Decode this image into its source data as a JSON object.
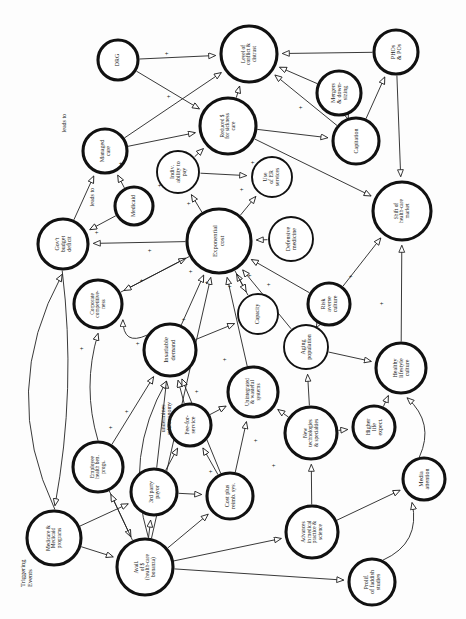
{
  "diagram": {
    "corner_label": "Triggering\nEvents",
    "rotation_note": "page rotated 90 degrees",
    "colors": {
      "node_stroke": "#111111",
      "node_fill": "#ffffff",
      "edge_stroke": "#222222",
      "background": "#ffffff"
    },
    "nodes": [
      {
        "id": "drg",
        "label": "DRG",
        "cx": 118,
        "cy": 60,
        "r": 20,
        "thick": "heavy"
      },
      {
        "id": "conflict",
        "label": "Level of\nconflict &\ndistrust",
        "cx": 249,
        "cy": 54,
        "r": 28,
        "thick": "heavy"
      },
      {
        "id": "phos",
        "label": "PHOs\n& POs",
        "cx": 396,
        "cy": 52,
        "r": 22,
        "thick": "heavy"
      },
      {
        "id": "mergers",
        "label": "Mergers\n& down-\nsizing",
        "cx": 339,
        "cy": 93,
        "r": 22,
        "thick": "heavy"
      },
      {
        "id": "reduced",
        "label": "Reduced $\nfor sickness\ncare",
        "cx": 228,
        "cy": 126,
        "r": 28,
        "thick": "heavy"
      },
      {
        "id": "capitation",
        "label": "Capitation",
        "cx": 356,
        "cy": 141,
        "r": 23,
        "thick": "heavy"
      },
      {
        "id": "managed",
        "label": "Managed\ncare",
        "cx": 105,
        "cy": 151,
        "r": 22,
        "thick": "heavy"
      },
      {
        "id": "indiv",
        "label": "Indiv.\nability to\npay",
        "cx": 178,
        "cy": 172,
        "r": 21,
        "thick": "medium"
      },
      {
        "id": "er",
        "label": "Use\nof ER\nservices",
        "cx": 272,
        "cy": 177,
        "r": 20,
        "thick": "medium"
      },
      {
        "id": "medicaid",
        "label": "Medicaid",
        "cx": 134,
        "cy": 206,
        "r": 19,
        "thick": "heavy"
      },
      {
        "id": "shift",
        "label": "Shift of\nhealth-care\nmarket",
        "cx": 402,
        "cy": 211,
        "r": 29,
        "thick": "heavy"
      },
      {
        "id": "deficit",
        "label": "Gov't\nbudget\ndeficit",
        "cx": 63,
        "cy": 244,
        "r": 25,
        "thick": "heavy"
      },
      {
        "id": "expcost",
        "label": "Exponential\ncost",
        "cx": 219,
        "cy": 241,
        "r": 32,
        "thick": "heavy"
      },
      {
        "id": "defensive",
        "label": "Defensive\nmedicine",
        "cx": 291,
        "cy": 239,
        "r": 22,
        "thick": "medium"
      },
      {
        "id": "corporate",
        "label": "Corporate\ncompetitive-\nness",
        "cx": 98,
        "cy": 304,
        "r": 24,
        "thick": "heavy"
      },
      {
        "id": "capacity",
        "label": "Capacity",
        "cx": 258,
        "cy": 314,
        "r": 20,
        "thick": "medium"
      },
      {
        "id": "risk",
        "label": "Risk\naverse\nculture",
        "cx": 329,
        "cy": 304,
        "r": 21,
        "thick": "heavy"
      },
      {
        "id": "insatiable",
        "label": "Insatiable\ndemand",
        "cx": 170,
        "cy": 350,
        "r": 26,
        "thick": "heavy"
      },
      {
        "id": "aging",
        "label": "Aging\npopulation",
        "cx": 306,
        "cy": 347,
        "r": 22,
        "thick": "medium"
      },
      {
        "id": "healthy",
        "label": "Healthy\nlifestyle\nculture",
        "cx": 401,
        "cy": 368,
        "r": 25,
        "thick": "heavy"
      },
      {
        "id": "unintegr",
        "label": "Unintegrated\n& wasteful\nsystems",
        "cx": 253,
        "cy": 392,
        "r": 25,
        "thick": "heavy"
      },
      {
        "id": "fee",
        "label": "Fee-for-\nservice",
        "cx": 190,
        "cy": 425,
        "r": 21,
        "thick": "heavy"
      },
      {
        "id": "newtech",
        "label": "New\ntechnologies\n& specialties",
        "cx": 311,
        "cy": 433,
        "r": 26,
        "thick": "heavy"
      },
      {
        "id": "higher",
        "label": "Higher\nlife\nexpect.",
        "cx": 374,
        "cy": 427,
        "r": 21,
        "thick": "heavy"
      },
      {
        "id": "employee",
        "label": "Employee\nhealth ben.\nprogs.",
        "cx": 98,
        "cy": 467,
        "r": 25,
        "thick": "heavy"
      },
      {
        "id": "thirdparty",
        "label": "3rd party\npayor",
        "cx": 154,
        "cy": 492,
        "r": 23,
        "thick": "heavy"
      },
      {
        "id": "costplus",
        "label": "Cost plus\nreimb. sys.",
        "cx": 230,
        "cy": 496,
        "r": 23,
        "thick": "heavy"
      },
      {
        "id": "media",
        "label": "Media\nattention",
        "cx": 424,
        "cy": 479,
        "r": 21,
        "thick": "heavy"
      },
      {
        "id": "medicare",
        "label": "Medicare &\nMedicaid\nprograms",
        "cx": 54,
        "cy": 538,
        "r": 27,
        "thick": "heavy"
      },
      {
        "id": "advances",
        "label": "Advances\nin medical\npractice &\nscience",
        "cx": 312,
        "cy": 532,
        "r": 26,
        "thick": "heavy"
      },
      {
        "id": "avail",
        "label": "Avail.\nof $\n(health-care\nbonanza)",
        "cx": 145,
        "cy": 567,
        "r": 28,
        "thick": "heavy"
      },
      {
        "id": "prolif",
        "label": "Prolif.\nof faddish\nstudies",
        "cx": 372,
        "cy": 582,
        "r": 23,
        "thick": "heavy"
      }
    ],
    "edge_labels": [
      {
        "id": "leadsto1",
        "text": "leads to",
        "x": 64,
        "y": 128
      },
      {
        "id": "leadsto2",
        "text": "leads to",
        "x": 92,
        "y": 202
      },
      {
        "id": "undermines",
        "text": "undermines\nmkt economy",
        "x": 166,
        "y": 420
      }
    ],
    "signs": [
      {
        "x": 166,
        "y": 50
      },
      {
        "x": 168,
        "y": 93
      },
      {
        "x": 300,
        "y": 104
      },
      {
        "x": 120,
        "y": 160
      },
      {
        "x": 159,
        "y": 182
      },
      {
        "x": 188,
        "y": 200
      },
      {
        "x": 252,
        "y": 159
      },
      {
        "x": 241,
        "y": 186
      },
      {
        "x": 96,
        "y": 229
      },
      {
        "x": 149,
        "y": 247
      },
      {
        "x": 141,
        "y": 277
      },
      {
        "x": 190,
        "y": 268
      },
      {
        "x": 206,
        "y": 279
      },
      {
        "x": 229,
        "y": 283
      },
      {
        "x": 249,
        "y": 272
      },
      {
        "x": 268,
        "y": 281
      },
      {
        "x": 81,
        "y": 345
      },
      {
        "x": 137,
        "y": 340
      },
      {
        "x": 183,
        "y": 316
      },
      {
        "x": 126,
        "y": 408
      },
      {
        "x": 110,
        "y": 424
      },
      {
        "x": 196,
        "y": 388
      },
      {
        "x": 224,
        "y": 356
      },
      {
        "x": 350,
        "y": 273
      },
      {
        "x": 381,
        "y": 300
      },
      {
        "x": 255,
        "y": 437
      },
      {
        "x": 210,
        "y": 468
      },
      {
        "x": 273,
        "y": 462
      }
    ]
  }
}
